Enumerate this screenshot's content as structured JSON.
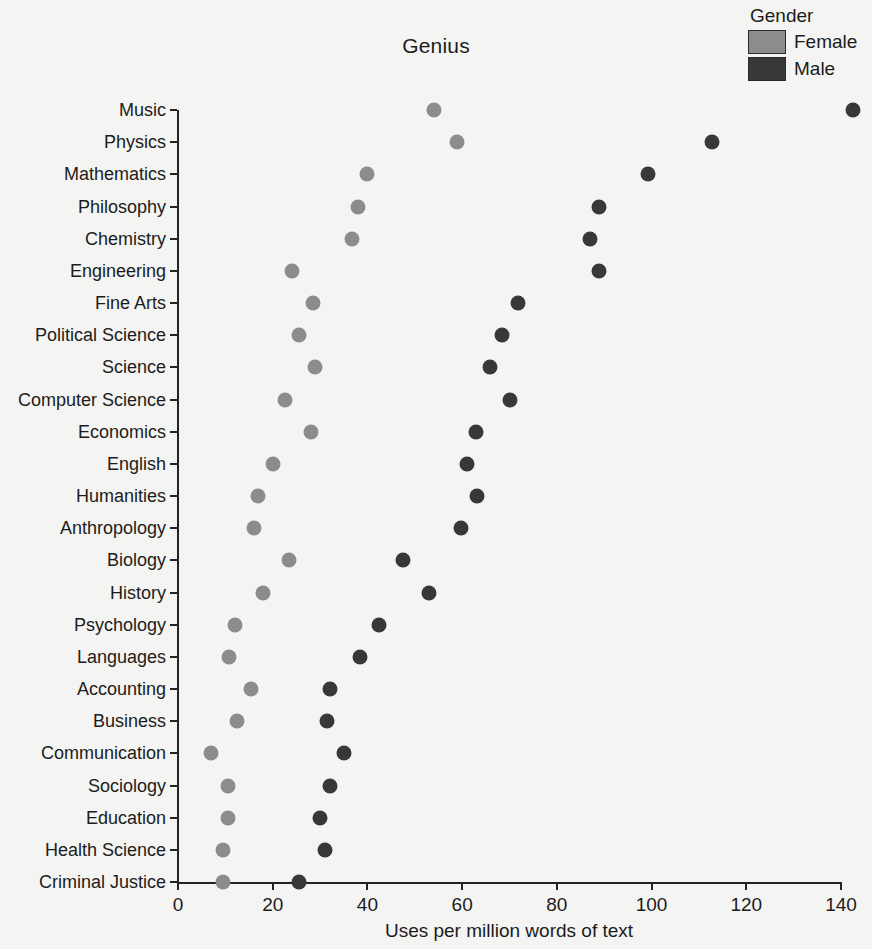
{
  "chart_data": {
    "type": "scatter",
    "title": "Genius",
    "xlabel": "Uses per million words of text",
    "ylabel": "",
    "xlim": [
      0,
      140
    ],
    "xticks": [
      0,
      20,
      40,
      60,
      80,
      100,
      120,
      140
    ],
    "grid": false,
    "legend_position": "top-right",
    "legend_title": "Gender",
    "categories": [
      "Music",
      "Physics",
      "Mathematics",
      "Philosophy",
      "Chemistry",
      "Engineering",
      "Fine Arts",
      "Political Science",
      "Science",
      "Computer Science",
      "Economics",
      "English",
      "Humanities",
      "Anthropology",
      "Biology",
      "History",
      "Psychology",
      "Languages",
      "Accounting",
      "Business",
      "Communication",
      "Sociology",
      "Education",
      "Health Science",
      "Criminal Justice"
    ],
    "series": [
      {
        "name": "Female",
        "color": "#8c8c8c",
        "values": [
          54.0,
          59.0,
          40.0,
          38.0,
          36.8,
          24.0,
          28.5,
          25.5,
          29.0,
          22.5,
          28.0,
          20.0,
          16.8,
          16.0,
          23.5,
          18.0,
          12.0,
          10.8,
          15.5,
          12.5,
          7.0,
          10.5,
          10.5,
          9.5,
          9.5
        ]
      },
      {
        "name": "Male",
        "color": "#383838",
        "values": [
          142.5,
          112.8,
          99.2,
          89.0,
          87.0,
          88.8,
          71.8,
          68.5,
          65.8,
          70.2,
          63.0,
          61.0,
          63.2,
          59.8,
          47.5,
          53.0,
          42.5,
          38.5,
          32.0,
          31.5,
          35.0,
          32.0,
          30.0,
          31.0,
          25.5
        ]
      }
    ]
  },
  "axis": {
    "tick_labels": [
      "0",
      "20",
      "40",
      "60",
      "80",
      "100",
      "120",
      "140"
    ]
  }
}
